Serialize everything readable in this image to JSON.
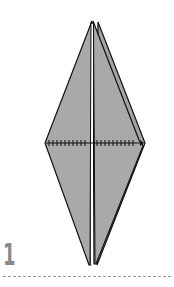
{
  "diagram": {
    "type": "origami-step",
    "step_number": "1",
    "fill_color": "#a9a9a9",
    "line_color": "#111111",
    "features": [
      "kite-shaped folded model",
      "center vertical gap",
      "horizontal valley-fold dotted line with arrow"
    ]
  }
}
